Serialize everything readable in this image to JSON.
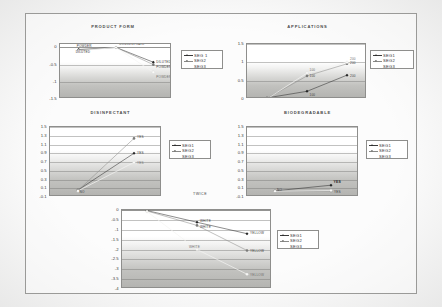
{
  "page": {
    "legend_labels_a": [
      "SEG 1",
      "SEG2",
      "SEG3"
    ],
    "legend_labels_b": [
      "SEG1",
      "SEG2",
      "SEG3"
    ],
    "legend_labels_c": [
      "SEG1",
      "SEG2",
      "SEG3"
    ],
    "twice_note": "TWICE"
  },
  "chart_data": [
    {
      "id": "product-form",
      "type": "line",
      "title": "PRODUCT FORM",
      "xlabel": "",
      "ylabel": "",
      "categories": [
        "POWDER",
        "CONCENTRATE",
        "DILUTED"
      ],
      "ylim": [
        -1.5,
        0.1
      ],
      "yticks": [
        0,
        -0.5,
        -1,
        -1.5
      ],
      "ytick_labels": [
        "0",
        "-0.5",
        "-1",
        "-1.5"
      ],
      "grid": true,
      "legend_position": "right",
      "series": [
        {
          "name": "SEG 1",
          "values": [
            -0.06,
            0.0,
            -0.43
          ]
        },
        {
          "name": "SEG2",
          "values": [
            -0.08,
            0.0,
            -0.5
          ]
        },
        {
          "name": "SEG3",
          "values": [
            -0.1,
            0.0,
            -0.72
          ]
        }
      ],
      "point_labels": [
        {
          "text": "POWDER",
          "series": 1,
          "index": 0
        },
        {
          "text": "DILUTED",
          "series": 2,
          "index": 0
        },
        {
          "text": "CONCENTRATE",
          "series": 1,
          "index": 1
        },
        {
          "text": "DILUTED",
          "series": 1,
          "index": 2
        },
        {
          "text": "POWDER",
          "series": 2,
          "index": 2
        },
        {
          "text": "POWDER",
          "series": 3,
          "index": 2
        }
      ]
    },
    {
      "id": "applications",
      "type": "line",
      "title": "APPLICATIONS",
      "xlabel": "",
      "ylabel": "",
      "categories": [
        "100",
        "200",
        "300"
      ],
      "ylim": [
        0,
        1.5
      ],
      "yticks": [
        1.5,
        1,
        0.5,
        0
      ],
      "ytick_labels": [
        "1.5",
        "1",
        "0.5",
        "0"
      ],
      "grid": true,
      "legend_position": "right",
      "series": [
        {
          "name": "SEG1",
          "values": [
            0.03,
            0.21,
            0.65
          ]
        },
        {
          "name": "SEG2",
          "values": [
            0.02,
            0.63,
            0.96
          ]
        },
        {
          "name": "SEG3",
          "values": [
            0.0,
            0.71,
            1.0
          ]
        }
      ],
      "point_labels": [
        {
          "text": "100",
          "series": 3,
          "index": 1
        },
        {
          "text": "100",
          "series": 2,
          "index": 1
        },
        {
          "text": "100",
          "series": 1,
          "index": 1
        },
        {
          "text": "200",
          "series": 3,
          "index": 2
        },
        {
          "text": "200",
          "series": 2,
          "index": 2
        },
        {
          "text": "200",
          "series": 1,
          "index": 2
        }
      ]
    },
    {
      "id": "disinfectant",
      "type": "line",
      "title": "DISINFECTANT",
      "xlabel": "TWICE",
      "ylabel": "",
      "categories": [
        "NO",
        "YES"
      ],
      "ylim": [
        -0.1,
        1.5
      ],
      "yticks": [
        1.5,
        1.3,
        1.1,
        0.9,
        0.7,
        0.5,
        0.3,
        0.1,
        -0.1
      ],
      "ytick_labels": [
        "1.5",
        "1.3",
        "1.1",
        "0.9",
        "0.7",
        "0.5",
        "0.3",
        "0.1",
        "-0.1"
      ],
      "grid": true,
      "legend_position": "right",
      "series": [
        {
          "name": "SEG1",
          "values": [
            0.06,
            0.9
          ]
        },
        {
          "name": "SEG2",
          "values": [
            0.05,
            1.24
          ]
        },
        {
          "name": "SEG3",
          "values": [
            0.04,
            0.69
          ]
        }
      ],
      "point_labels": [
        {
          "text": "NO",
          "series": 1,
          "index": 0
        },
        {
          "text": "YES",
          "series": 2,
          "index": 1
        },
        {
          "text": "YES",
          "series": 1,
          "index": 1
        },
        {
          "text": "YES",
          "series": 3,
          "index": 1
        }
      ]
    },
    {
      "id": "biodegradable",
      "type": "line",
      "title": "BIODEGRADABLE",
      "xlabel": "",
      "ylabel": "",
      "categories": [
        "NO",
        "YES"
      ],
      "ylim": [
        -0.1,
        1.5
      ],
      "yticks": [
        1.5,
        1.3,
        1.1,
        0.9,
        0.7,
        0.5,
        0.3,
        0.1,
        -0.1
      ],
      "ytick_labels": [
        "1.5",
        "1.3",
        "1.1",
        "0.9",
        "0.7",
        "0.5",
        "0.3",
        "0.1",
        "-0.1"
      ],
      "grid": true,
      "legend_position": "right",
      "series": [
        {
          "name": "SEG1",
          "values": [
            0.04,
            0.17
          ]
        },
        {
          "name": "SEG2",
          "values": [
            0.03,
            0.04
          ]
        },
        {
          "name": "SEG3",
          "values": [
            0.03,
            0.05
          ]
        }
      ],
      "point_labels": [
        {
          "text": "NO",
          "series": 1,
          "index": 0
        },
        {
          "text": "YES",
          "series": 1,
          "index": 1
        },
        {
          "text": "YES",
          "series": 2,
          "index": 1
        }
      ]
    },
    {
      "id": "bottom-chart",
      "type": "line",
      "title": "",
      "xlabel": "",
      "ylabel": "",
      "categories": [
        "BLUE",
        "WHITE",
        "YELLOW"
      ],
      "ylim": [
        -4,
        0
      ],
      "yticks": [
        0,
        -0.5,
        -1,
        -1.5,
        -2,
        -2.5,
        -3,
        -3.5,
        -4
      ],
      "ytick_labels": [
        "0",
        "-0.5",
        "-1",
        "-1.5",
        "-2",
        "-2.5",
        "-3",
        "-3.5",
        "-4"
      ],
      "grid": true,
      "legend_position": "right",
      "series": [
        {
          "name": "SEG1",
          "values": [
            -0.03,
            -0.62,
            -1.2
          ]
        },
        {
          "name": "SEG2",
          "values": [
            -0.05,
            -0.78,
            -2.05
          ]
        },
        {
          "name": "SEG3",
          "values": [
            -0.08,
            -2.0,
            -3.25
          ]
        }
      ],
      "point_labels": [
        {
          "text": "BLUE",
          "series": 1,
          "index": 0
        },
        {
          "text": "WHITE",
          "series": 1,
          "index": 1
        },
        {
          "text": "WHITE",
          "series": 2,
          "index": 1
        },
        {
          "text": "WHITE",
          "series": 3,
          "index": 1
        },
        {
          "text": "YELLOW",
          "series": 1,
          "index": 2
        },
        {
          "text": "YELLOW",
          "series": 2,
          "index": 2
        },
        {
          "text": "YELLOW",
          "series": 3,
          "index": 2
        }
      ]
    }
  ]
}
